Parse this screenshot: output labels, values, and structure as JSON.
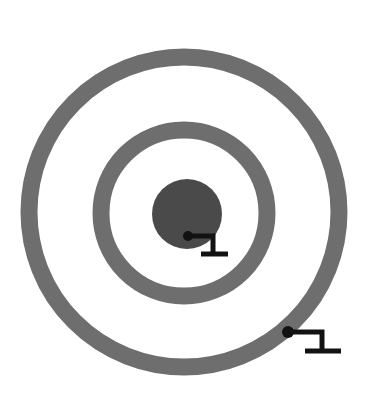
{
  "figure": {
    "name": "concentric-circle-target-diagram",
    "background_color": "#ffffff",
    "width": 366,
    "height": 407
  },
  "colors": {
    "ring_gray": "#6e6e6e",
    "core_gray": "#4a4a4a",
    "annotation_black": "#121212",
    "background": "#ffffff"
  },
  "chart_data": {
    "type": "diagram",
    "subtitle": "",
    "xlabel": "",
    "ylabel": "",
    "grid": false,
    "legend": "none",
    "shapes": [
      {
        "name": "outer-ring",
        "kind": "ring",
        "cx": 184,
        "cy": 212,
        "radius": 155,
        "stroke_width": 17,
        "fill": "none",
        "stroke": "#6e6e6e"
      },
      {
        "name": "middle-ring",
        "kind": "ring",
        "cx": 184,
        "cy": 213,
        "radius": 83,
        "stroke_width": 17,
        "fill": "none",
        "stroke": "#6e6e6e"
      },
      {
        "name": "inner-disc",
        "kind": "disc",
        "cx": 187,
        "cy": 214,
        "radius": 35,
        "stroke_width": 0,
        "fill": "#4a4a4a",
        "stroke": "none"
      }
    ],
    "annotations": [
      {
        "name": "inner-disc-callout",
        "label": "",
        "target_shape": "inner-disc",
        "dot": {
          "x": 188,
          "y": 236,
          "radius": 5
        },
        "elbow": {
          "x": 213,
          "y": 236
        },
        "drop": {
          "x": 213,
          "y": 254
        },
        "baseline": {
          "x1": 201,
          "x2": 228,
          "y": 254
        },
        "stroke_width": 5,
        "color": "#121212"
      },
      {
        "name": "outer-ring-callout",
        "label": "",
        "target_shape": "outer-ring",
        "dot": {
          "x": 288,
          "y": 332,
          "radius": 6
        },
        "elbow": {
          "x": 322,
          "y": 332
        },
        "drop": {
          "x": 322,
          "y": 351
        },
        "baseline": {
          "x1": 305,
          "x2": 341,
          "y": 351
        },
        "stroke_width": 5,
        "color": "#121212"
      }
    ]
  }
}
